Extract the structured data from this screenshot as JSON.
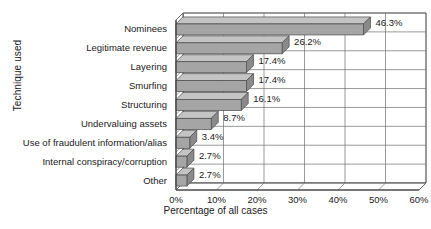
{
  "chart_data": {
    "type": "bar",
    "orientation": "horizontal",
    "style": "3d",
    "title": "",
    "xlabel": "Percentage of all cases",
    "ylabel": "Technique used",
    "categories": [
      "Nominees",
      "Legitimate revenue",
      "Layering",
      "Smurfing",
      "Structuring",
      "Undervaluing assets",
      "Use of fraudulent information/alias",
      "Internal conspiracy/corruption",
      "Other"
    ],
    "values": [
      46.3,
      26.2,
      17.4,
      17.4,
      16.1,
      8.7,
      3.4,
      2.7,
      2.7
    ],
    "value_labels": [
      "46.3%",
      "26.2%",
      "17.4%",
      "17.4%",
      "16.1%",
      "8.7%",
      "3.4%",
      "2.7%",
      "2.7%"
    ],
    "xticks": [
      0,
      10,
      20,
      30,
      40,
      50,
      60
    ],
    "xtick_labels": [
      "0%",
      "10%",
      "20%",
      "30%",
      "40%",
      "50%",
      "60%"
    ],
    "xlim": [
      0,
      60
    ],
    "grid": true,
    "legend": false,
    "colors": {
      "bar_front": "#a5a5a5",
      "bar_top": "#c4c4c4",
      "bar_side": "#8a8a8a",
      "bar_edge": "#4a4a4a",
      "axis": "#3c3c3c",
      "grid": "#6e6e6e",
      "text": "#1a1a1a",
      "wall": "#ffffff"
    }
  }
}
